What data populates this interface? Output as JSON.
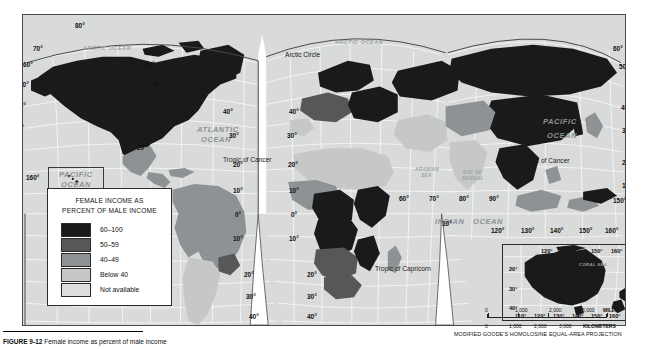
{
  "figure": {
    "caption_label": "FIGURE 9-12",
    "caption_text": "Female income as percent of male income"
  },
  "map": {
    "projection_note": "MODIFIED GOODE'S HOMOLOSINE EQUAL-AREA PROJECTION",
    "ocean_labels": [
      {
        "name": "ARCTIC OCEAN",
        "x": 60,
        "y": 30,
        "cls": "arctic-o"
      },
      {
        "name": "ARCTIC OCEAN",
        "x": 318,
        "y": 26,
        "cls": "arctic-o"
      },
      {
        "name": "ATLANTIC",
        "x": 176,
        "y": 114,
        "cls": "ocean"
      },
      {
        "name": "OCEAN",
        "x": 181,
        "y": 124,
        "cls": "ocean"
      },
      {
        "name": "PACIFIC",
        "x": 57,
        "y": 160,
        "cls": "ocean"
      },
      {
        "name": "OCEAN",
        "x": 59,
        "y": 170,
        "cls": "ocean"
      },
      {
        "name": "PACIFIC",
        "x": 563,
        "y": 105,
        "cls": "ocean"
      },
      {
        "name": "OCEAN",
        "x": 566,
        "y": 119,
        "cls": "ocean"
      },
      {
        "name": "INDIAN",
        "x": 432,
        "y": 207,
        "cls": "ocean"
      },
      {
        "name": "OCEAN",
        "x": 468,
        "y": 207,
        "cls": "ocean"
      }
    ],
    "sea_labels": [
      {
        "name": "ARABIAN",
        "x": 411,
        "y": 157
      },
      {
        "name": "SEA",
        "x": 417,
        "y": 163
      },
      {
        "name": "BAY OF",
        "x": 458,
        "y": 160
      },
      {
        "name": "BENGAL",
        "x": 457,
        "y": 166
      },
      {
        "name": "CORAL SEA",
        "x": 560,
        "y": 242
      }
    ],
    "line_labels": [
      {
        "name": "Arctic Circle",
        "x": 284,
        "y": 40
      },
      {
        "name": "Tropic of Cancer",
        "x": 222,
        "y": 145
      },
      {
        "name": "Tropic of Cancer",
        "x": 543,
        "y": 146
      },
      {
        "name": "Tropic of Capricorn",
        "x": 374,
        "y": 254
      }
    ],
    "lat_labels_left": [
      {
        "v": "70°",
        "x": 32,
        "y": 44
      },
      {
        "v": "60°",
        "x": 22,
        "y": 60
      },
      {
        "v": "50°",
        "x": 18,
        "y": 80
      },
      {
        "v": "40°",
        "x": 15,
        "y": 101
      },
      {
        "v": "30°",
        "x": 13,
        "y": 123
      },
      {
        "v": "20°",
        "x": 12,
        "y": 144
      },
      {
        "v": "10°",
        "x": 12,
        "y": 172
      },
      {
        "v": "0°",
        "x": 12,
        "y": 197
      },
      {
        "v": "10°",
        "x": 12,
        "y": 221
      },
      {
        "v": "20°",
        "x": 12,
        "y": 245
      },
      {
        "v": "30°",
        "x": 12,
        "y": 270
      },
      {
        "v": "40°",
        "x": 12,
        "y": 292
      },
      {
        "v": "50°",
        "x": 12,
        "y": 314
      }
    ],
    "deg_labels": [
      {
        "v": "80°",
        "x": 74,
        "y": 21
      },
      {
        "v": "160°",
        "x": 25,
        "y": 173
      },
      {
        "v": "60°",
        "x": 144,
        "y": 60
      },
      {
        "v": "50°",
        "x": 152,
        "y": 80
      },
      {
        "v": "40°",
        "x": 222,
        "y": 107
      },
      {
        "v": "30°",
        "x": 228,
        "y": 131
      },
      {
        "v": "20°",
        "x": 232,
        "y": 160
      },
      {
        "v": "20°",
        "x": 136,
        "y": 143
      },
      {
        "v": "10°",
        "x": 232,
        "y": 186
      },
      {
        "v": "0°",
        "x": 234,
        "y": 210
      },
      {
        "v": "10°",
        "x": 232,
        "y": 234
      },
      {
        "v": "20°",
        "x": 243,
        "y": 270
      },
      {
        "v": "30°",
        "x": 245,
        "y": 292
      },
      {
        "v": "40°",
        "x": 248,
        "y": 312
      },
      {
        "v": "50°",
        "x": 250,
        "y": 331
      },
      {
        "v": "40°",
        "x": 288,
        "y": 107
      },
      {
        "v": "30°",
        "x": 286,
        "y": 131
      },
      {
        "v": "20°",
        "x": 287,
        "y": 160
      },
      {
        "v": "10°",
        "x": 288,
        "y": 186
      },
      {
        "v": "0°",
        "x": 290,
        "y": 210
      },
      {
        "v": "10°",
        "x": 288,
        "y": 234
      },
      {
        "v": "20°",
        "x": 306,
        "y": 270
      },
      {
        "v": "30°",
        "x": 306,
        "y": 292
      },
      {
        "v": "40°",
        "x": 306,
        "y": 312
      },
      {
        "v": "50°",
        "x": 306,
        "y": 331
      },
      {
        "v": "60°",
        "x": 398,
        "y": 194
      },
      {
        "v": "70°",
        "x": 428,
        "y": 194
      },
      {
        "v": "80°",
        "x": 458,
        "y": 194
      },
      {
        "v": "90°",
        "x": 488,
        "y": 194
      },
      {
        "v": "10°",
        "x": 441,
        "y": 219
      },
      {
        "v": "120°",
        "x": 490,
        "y": 226
      },
      {
        "v": "130°",
        "x": 520,
        "y": 226
      },
      {
        "v": "140°",
        "x": 549,
        "y": 226
      },
      {
        "v": "150°",
        "x": 578,
        "y": 226
      },
      {
        "v": "160°",
        "x": 604,
        "y": 226
      },
      {
        "v": "150°",
        "x": 612,
        "y": 196
      },
      {
        "v": "60°",
        "x": 612,
        "y": 44
      },
      {
        "v": "50°",
        "x": 618,
        "y": 62
      },
      {
        "v": "40°",
        "x": 620,
        "y": 103
      },
      {
        "v": "30°",
        "x": 621,
        "y": 126
      },
      {
        "v": "20°",
        "x": 621,
        "y": 158
      },
      {
        "v": "10°",
        "x": 621,
        "y": 181
      }
    ]
  },
  "legend": {
    "title_line1": "FEMALE INCOME AS",
    "title_line2": "PERCENT OF MALE INCOME",
    "classes": [
      {
        "label": "60–100",
        "color": "#1a1a1a"
      },
      {
        "label": "50–59",
        "color": "#555758"
      },
      {
        "label": "40–49",
        "color": "#8f9294"
      },
      {
        "label": "Below 40",
        "color": "#c6c8c8"
      },
      {
        "label": "Not available",
        "color": "#dcdddd"
      }
    ]
  },
  "inset_australia": {
    "name": "Australia and New Zealand inset",
    "deg_labels": [
      {
        "v": "120°",
        "x": 38,
        "y": 3
      },
      {
        "v": "150°",
        "x": 88,
        "y": 3
      },
      {
        "v": "160°",
        "x": 108,
        "y": 3
      },
      {
        "v": "170°",
        "x": 128,
        "y": 3
      },
      {
        "v": "20°",
        "x": 6,
        "y": 21
      },
      {
        "v": "30°",
        "x": 6,
        "y": 41
      },
      {
        "v": "40°",
        "x": 6,
        "y": 60
      },
      {
        "v": "20°",
        "x": 131,
        "y": 21
      },
      {
        "v": "30°",
        "x": 131,
        "y": 41
      },
      {
        "v": "110°",
        "x": 12,
        "y": 68
      },
      {
        "v": "120°",
        "x": 31,
        "y": 68
      },
      {
        "v": "130°",
        "x": 50,
        "y": 68
      },
      {
        "v": "140°",
        "x": 69,
        "y": 68
      },
      {
        "v": "150°",
        "x": 88,
        "y": 68
      },
      {
        "v": "160°",
        "x": 106,
        "y": 68
      },
      {
        "v": "180°",
        "x": 132,
        "y": 68
      }
    ],
    "sea_label": "CORAL SEA"
  },
  "scales": {
    "miles": {
      "ticks": [
        "0",
        "1,000",
        "2,000",
        "3,000"
      ],
      "unit": "MILES"
    },
    "kilometers": {
      "ticks": [
        "0",
        "1,000",
        "2,000",
        "3,000"
      ],
      "unit": "KILOMETERS"
    }
  },
  "chart_data": {
    "type": "map",
    "title": "FEMALE INCOME AS PERCENT OF MALE INCOME",
    "projection": "Modified Goode's Homolosine Equal-Area",
    "classes": [
      "60–100",
      "50–59",
      "40–49",
      "Below 40",
      "Not available"
    ],
    "class_colors": [
      "#1a1a1a",
      "#555758",
      "#8f9294",
      "#c6c8c8",
      "#dcdddd"
    ],
    "regions": [
      {
        "region": "Canada",
        "class": "60–100"
      },
      {
        "region": "United States",
        "class": "60–100"
      },
      {
        "region": "Greenland",
        "class": "60–100"
      },
      {
        "region": "Mexico",
        "class": "40–49"
      },
      {
        "region": "Central America",
        "class": "40–49"
      },
      {
        "region": "Brazil",
        "class": "40–49"
      },
      {
        "region": "Argentina",
        "class": "Below 40"
      },
      {
        "region": "Chile",
        "class": "Below 40"
      },
      {
        "region": "Peru",
        "class": "40–49"
      },
      {
        "region": "Colombia",
        "class": "40–49"
      },
      {
        "region": "Venezuela",
        "class": "40–49"
      },
      {
        "region": "Uruguay",
        "class": "50–59"
      },
      {
        "region": "Northern Africa",
        "class": "Below 40"
      },
      {
        "region": "Tanzania",
        "class": "60–100"
      },
      {
        "region": "Democratic Republic of Congo",
        "class": "60–100"
      },
      {
        "region": "Angola",
        "class": "50–59"
      },
      {
        "region": "Mozambique",
        "class": "60–100"
      },
      {
        "region": "South Africa",
        "class": "50–59"
      },
      {
        "region": "Western Europe",
        "class": "50–59"
      },
      {
        "region": "Scandinavia",
        "class": "60–100"
      },
      {
        "region": "Russia",
        "class": "60–100"
      },
      {
        "region": "China",
        "class": "60–100"
      },
      {
        "region": "Mongolia",
        "class": "60–100"
      },
      {
        "region": "India",
        "class": "Below 40"
      },
      {
        "region": "Middle East",
        "class": "Below 40"
      },
      {
        "region": "Southeast Asia",
        "class": "60–100"
      },
      {
        "region": "Indonesia",
        "class": "40–49"
      },
      {
        "region": "Japan",
        "class": "40–49"
      },
      {
        "region": "Australia",
        "class": "60–100"
      },
      {
        "region": "New Zealand",
        "class": "60–100"
      }
    ],
    "scalebar_miles": [
      0,
      1000,
      2000,
      3000
    ],
    "scalebar_km": [
      0,
      1000,
      2000,
      3000
    ]
  }
}
